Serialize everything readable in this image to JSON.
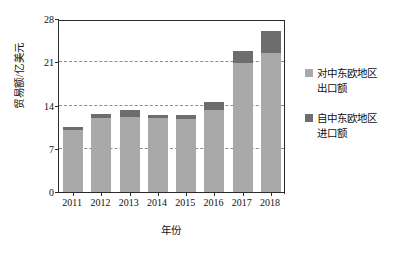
{
  "chart_data": {
    "type": "bar",
    "subtype": "stacked-vertical",
    "title": "",
    "xlabel": "年份",
    "ylabel": "贸易额/亿美元",
    "categories": [
      "2011",
      "2012",
      "2013",
      "2014",
      "2015",
      "2016",
      "2017",
      "2018"
    ],
    "series": [
      {
        "name": "对中东欧地区出口额",
        "color": "#a9a9a9",
        "values": [
          10.0,
          12.0,
          12.2,
          11.9,
          11.8,
          13.2,
          20.9,
          22.5
        ]
      },
      {
        "name": "自中东欧地区进口额",
        "color": "#6d6d6d",
        "values": [
          0.6,
          0.6,
          1.1,
          0.6,
          0.7,
          1.4,
          2.0,
          3.5
        ]
      }
    ],
    "totals": [
      10.6,
      12.6,
      13.3,
      12.5,
      12.5,
      14.6,
      22.9,
      26.0
    ],
    "ylim": [
      0,
      28
    ],
    "yticks": [
      0,
      7,
      14,
      21,
      28
    ],
    "ytick_labels": [
      "0",
      "7",
      "14",
      "21",
      "28"
    ],
    "grid": {
      "horizontal": true,
      "style": "dashed",
      "at": [
        7,
        14,
        21
      ]
    },
    "legend": {
      "position": "right",
      "entries": [
        {
          "line1": "对中东欧地区",
          "line2": "出口额",
          "color": "#a9a9a9"
        },
        {
          "line1": "自中东欧地区",
          "line2": "进口额",
          "color": "#6d6d6d"
        }
      ]
    },
    "axis": {
      "left_spine": true,
      "right_spine": true,
      "top_spine": true,
      "bottom_spine": true
    }
  }
}
